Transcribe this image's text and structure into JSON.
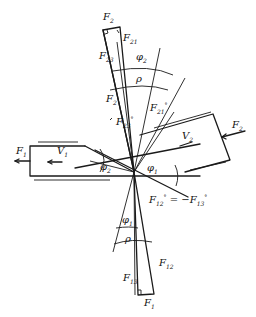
{
  "diagram": {
    "colors": {
      "line": "#1a1a1a",
      "background": "#ffffff"
    },
    "labels": {
      "f2_top": {
        "base": "F",
        "sub": "2"
      },
      "f21": {
        "base": "F",
        "sub": "21"
      },
      "f23": {
        "base": "F",
        "sub": "23"
      },
      "phi2_top": {
        "base": "φ",
        "sub": "2"
      },
      "rho_top": {
        "base": "ρ"
      },
      "f2_mid": {
        "base": "F",
        "sub": "2"
      },
      "f21_star": {
        "base": "F",
        "sub": "21",
        "sup": "°"
      },
      "f23_star": {
        "base": "F",
        "sub": "23",
        "sup": "°"
      },
      "f1_left": {
        "base": "F",
        "sub": "1"
      },
      "v1": {
        "base": "V",
        "sub": "1"
      },
      "phi2_left": {
        "base": "φ",
        "sub": "2"
      },
      "v2": {
        "base": "V",
        "sub": "2"
      },
      "f2_right": {
        "base": "F",
        "sub": "2"
      },
      "phi1_center": {
        "base": "φ",
        "sub": "1"
      },
      "equation": {
        "lhs": "F",
        "lhs_sub": "12",
        "lhs_sup": "°",
        "eq": " = −",
        "rhs": "F",
        "rhs_sub": "13",
        "rhs_sup": "°"
      },
      "phi1_bottom": {
        "base": "φ",
        "sub": "1"
      },
      "rho_bottom": {
        "base": "ρ"
      },
      "f12": {
        "base": "F",
        "sub": "12"
      },
      "f13": {
        "base": "F",
        "sub": "13"
      },
      "f1_bottom": {
        "base": "F",
        "sub": "1"
      }
    }
  }
}
